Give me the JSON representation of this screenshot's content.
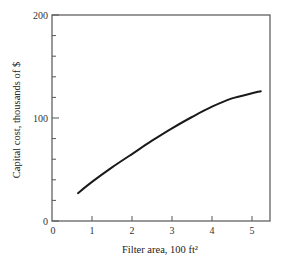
{
  "chart_data": {
    "type": "line",
    "title": "",
    "xlabel": "Filter area, 100 ft²",
    "ylabel": "Capital cost, thousands of $",
    "xlim": [
      0,
      5.45
    ],
    "ylim": [
      0,
      200
    ],
    "x_ticks": [
      0,
      1,
      2,
      3,
      4,
      5
    ],
    "x_tick_labels": [
      "0",
      "1",
      "2",
      "3",
      "4",
      "5"
    ],
    "y_ticks_labeled": [
      0,
      100,
      200
    ],
    "y_tick_labels": [
      "0",
      "100",
      "200"
    ],
    "y_minor_ticks": [
      20,
      40,
      60,
      80,
      120,
      140,
      160,
      180
    ],
    "grid": false,
    "legend": null,
    "series": [
      {
        "name": "Capital cost",
        "x": [
          0.65,
          1.0,
          1.5,
          2.0,
          2.5,
          3.0,
          3.5,
          4.0,
          4.5,
          5.0,
          5.22
        ],
        "values": [
          27,
          38,
          52,
          65,
          78,
          90,
          101,
          111,
          119,
          124,
          126
        ]
      }
    ]
  },
  "colors": {
    "axis": "#555555",
    "line": "#1a1a1a",
    "background": "#ffffff"
  }
}
